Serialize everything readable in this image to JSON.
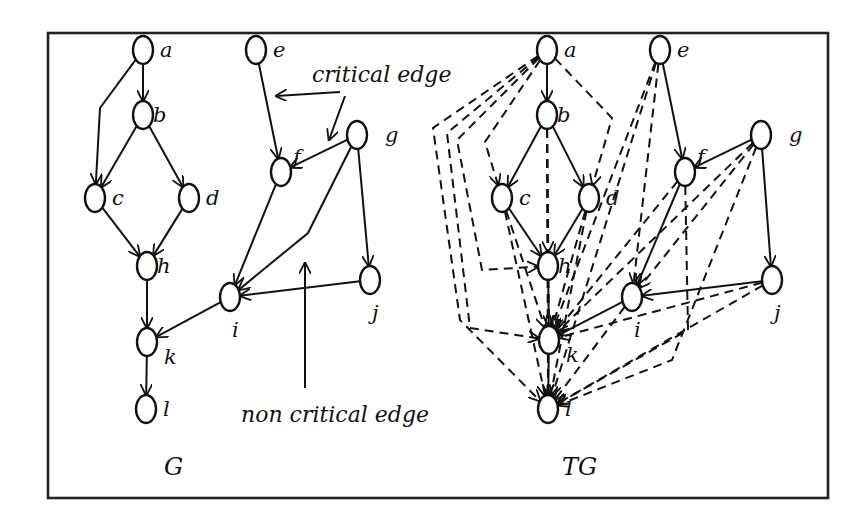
{
  "figure": {
    "frame": {
      "x": 48,
      "y": 33,
      "w": 780,
      "h": 465
    },
    "colors": {
      "ink": "#111111",
      "background": "#ffffff"
    },
    "annotations": {
      "critical_edge": {
        "label": "critical edge",
        "x": 312,
        "y": 82
      },
      "non_critical_edge": {
        "label": "non critical edge",
        "x": 241,
        "y": 422
      }
    },
    "graphs": [
      {
        "id": "G",
        "caption": "G",
        "caption_pos": {
          "x": 164,
          "y": 475
        },
        "nodes": [
          {
            "id": "a",
            "label": "a",
            "x": 143,
            "y": 50
          },
          {
            "id": "b",
            "label": "b",
            "x": 143,
            "y": 115
          },
          {
            "id": "c",
            "label": "c",
            "x": 95,
            "y": 198
          },
          {
            "id": "d",
            "label": "d",
            "x": 189,
            "y": 198
          },
          {
            "id": "h",
            "label": "h",
            "x": 147,
            "y": 266
          },
          {
            "id": "k",
            "label": "k",
            "x": 147,
            "y": 342
          },
          {
            "id": "l",
            "label": "l",
            "x": 146,
            "y": 409
          },
          {
            "id": "e",
            "label": "e",
            "x": 256,
            "y": 50
          },
          {
            "id": "f",
            "label": "f",
            "x": 281,
            "y": 172
          },
          {
            "id": "g",
            "label": "g",
            "x": 357,
            "y": 135
          },
          {
            "id": "i",
            "label": "i",
            "x": 230,
            "y": 297
          },
          {
            "id": "j",
            "label": "j",
            "x": 370,
            "y": 280
          }
        ],
        "edges": [
          {
            "from": "a",
            "to": "b",
            "type": "solid"
          },
          {
            "from": "a",
            "to": "c",
            "type": "solid",
            "via": [
              [
                100,
                108
              ]
            ]
          },
          {
            "from": "b",
            "to": "c",
            "type": "solid"
          },
          {
            "from": "b",
            "to": "d",
            "type": "solid"
          },
          {
            "from": "c",
            "to": "h",
            "type": "solid"
          },
          {
            "from": "d",
            "to": "h",
            "type": "solid"
          },
          {
            "from": "h",
            "to": "k",
            "type": "solid"
          },
          {
            "from": "k",
            "to": "l",
            "type": "solid"
          },
          {
            "from": "e",
            "to": "f",
            "type": "solid"
          },
          {
            "from": "g",
            "to": "f",
            "type": "solid"
          },
          {
            "from": "f",
            "to": "i",
            "type": "solid"
          },
          {
            "from": "g",
            "to": "i",
            "type": "solid",
            "via": [
              [
                308,
                233
              ]
            ]
          },
          {
            "from": "g",
            "to": "j",
            "type": "solid"
          },
          {
            "from": "j",
            "to": "i",
            "type": "solid"
          },
          {
            "from": "i",
            "to": "k",
            "type": "solid"
          }
        ]
      },
      {
        "id": "TG",
        "caption": "TG",
        "caption_pos": {
          "x": 562,
          "y": 475
        },
        "nodes": [
          {
            "id": "a",
            "label": "a",
            "x": 547,
            "y": 50
          },
          {
            "id": "b",
            "label": "b",
            "x": 547,
            "y": 115
          },
          {
            "id": "c",
            "label": "c",
            "x": 502,
            "y": 198
          },
          {
            "id": "d",
            "label": "d",
            "x": 589,
            "y": 198
          },
          {
            "id": "h",
            "label": "h",
            "x": 548,
            "y": 266
          },
          {
            "id": "k",
            "label": "k",
            "x": 549,
            "y": 340
          },
          {
            "id": "l",
            "label": "l",
            "x": 548,
            "y": 409
          },
          {
            "id": "e",
            "label": "e",
            "x": 660,
            "y": 50
          },
          {
            "id": "f",
            "label": "f",
            "x": 685,
            "y": 172
          },
          {
            "id": "g",
            "label": "g",
            "x": 761,
            "y": 135
          },
          {
            "id": "i",
            "label": "i",
            "x": 632,
            "y": 297
          },
          {
            "id": "j",
            "label": "j",
            "x": 772,
            "y": 280
          }
        ],
        "edges": [
          {
            "from": "a",
            "to": "b",
            "type": "solid"
          },
          {
            "from": "b",
            "to": "c",
            "type": "solid"
          },
          {
            "from": "b",
            "to": "d",
            "type": "solid"
          },
          {
            "from": "c",
            "to": "h",
            "type": "solid"
          },
          {
            "from": "d",
            "to": "h",
            "type": "solid"
          },
          {
            "from": "h",
            "to": "k",
            "type": "solid"
          },
          {
            "from": "k",
            "to": "l",
            "type": "solid"
          },
          {
            "from": "e",
            "to": "f",
            "type": "solid"
          },
          {
            "from": "g",
            "to": "f",
            "type": "solid"
          },
          {
            "from": "f",
            "to": "i",
            "type": "solid"
          },
          {
            "from": "g",
            "to": "j",
            "type": "solid"
          },
          {
            "from": "j",
            "to": "i",
            "type": "solid"
          },
          {
            "from": "i",
            "to": "k",
            "type": "solid"
          },
          {
            "from": "a",
            "to": "c",
            "type": "dashed",
            "via": [
              [
                485,
                142
              ]
            ]
          },
          {
            "from": "a",
            "to": "d",
            "type": "dashed",
            "via": [
              [
                612,
                118
              ]
            ]
          },
          {
            "from": "a",
            "to": "h",
            "type": "dashed",
            "via": [
              [
                457,
                140
              ],
              [
                482,
                270
              ]
            ]
          },
          {
            "from": "a",
            "to": "k",
            "type": "dashed",
            "via": [
              [
                447,
                133
              ],
              [
                470,
                328
              ]
            ]
          },
          {
            "from": "a",
            "to": "l",
            "type": "dashed",
            "via": [
              [
                433,
                128
              ],
              [
                460,
                320
              ]
            ]
          },
          {
            "from": "b",
            "to": "h",
            "type": "dashed"
          },
          {
            "from": "b",
            "to": "k",
            "type": "dashed"
          },
          {
            "from": "b",
            "to": "l",
            "type": "dashed"
          },
          {
            "from": "c",
            "to": "k",
            "type": "dashed"
          },
          {
            "from": "c",
            "to": "l",
            "type": "dashed"
          },
          {
            "from": "d",
            "to": "k",
            "type": "dashed"
          },
          {
            "from": "d",
            "to": "l",
            "type": "dashed"
          },
          {
            "from": "e",
            "to": "i",
            "type": "dashed"
          },
          {
            "from": "e",
            "to": "k",
            "type": "dashed"
          },
          {
            "from": "e",
            "to": "l",
            "type": "dashed"
          },
          {
            "from": "f",
            "to": "k",
            "type": "dashed"
          },
          {
            "from": "f",
            "to": "l",
            "type": "dashed",
            "via": [
              [
                688,
                330
              ]
            ]
          },
          {
            "from": "g",
            "to": "i",
            "type": "dashed"
          },
          {
            "from": "g",
            "to": "k",
            "type": "dashed"
          },
          {
            "from": "g",
            "to": "l",
            "type": "dashed",
            "via": [
              [
                672,
                360
              ]
            ]
          },
          {
            "from": "j",
            "to": "k",
            "type": "dashed"
          },
          {
            "from": "j",
            "to": "l",
            "type": "dashed"
          },
          {
            "from": "i",
            "to": "l",
            "type": "dashed"
          }
        ]
      }
    ]
  }
}
